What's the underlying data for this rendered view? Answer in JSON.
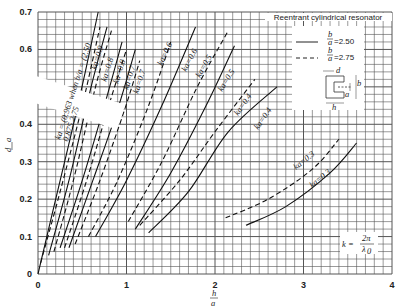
{
  "chart_data": {
    "type": "line",
    "title": "Reentrant cylindrical resonator",
    "xlabel": "h/a",
    "ylabel": "d/a",
    "xlim": [
      0,
      4
    ],
    "ylim": [
      0,
      0.7
    ],
    "x_ticks": [
      "0",
      "1",
      "2",
      "3",
      "4"
    ],
    "y_ticks": [
      "0",
      "0.1",
      "0.2",
      "0.3",
      "0.4",
      "0.5",
      "0.6",
      "0.7"
    ],
    "grid": true,
    "legend": {
      "title": "Reentrant cylindrical resonator",
      "position": "upper right",
      "entries": [
        {
          "style": "solid",
          "label": "b/a=2.50"
        },
        {
          "style": "dashed",
          "label": "b/a=2.75"
        }
      ]
    },
    "annotations": [
      "ka = { 0.963 / 0.875 when b/a = { 2.50 / 2.75",
      "k = 2π/λ0"
    ],
    "series": [
      {
        "name": "ka=0.963 (b/a=2.50)",
        "style": "solid",
        "points": [
          [
            0,
            0
          ],
          [
            0.2,
            0.2
          ],
          [
            0.45,
            0.45
          ],
          [
            0.68,
            0.7
          ]
        ]
      },
      {
        "name": "ka=0.875 (b/a=2.75)",
        "style": "dashed",
        "points": [
          [
            0.03,
            0.03
          ],
          [
            0.25,
            0.22
          ],
          [
            0.5,
            0.45
          ],
          [
            0.7,
            0.66
          ]
        ]
      },
      {
        "name": "ka=0.9 (b/a=2.50)",
        "style": "solid",
        "points": [
          [
            0.12,
            0.05
          ],
          [
            0.35,
            0.25
          ],
          [
            0.6,
            0.5
          ],
          [
            0.78,
            0.66
          ]
        ]
      },
      {
        "name": "ka=0.9 (b/a=2.75)",
        "style": "dashed",
        "points": [
          [
            0.18,
            0.06
          ],
          [
            0.4,
            0.25
          ],
          [
            0.65,
            0.5
          ],
          [
            0.83,
            0.65
          ]
        ]
      },
      {
        "name": "ka=0.8 (b/a=2.50)",
        "style": "solid",
        "points": [
          [
            0.25,
            0.07
          ],
          [
            0.5,
            0.25
          ],
          [
            0.75,
            0.45
          ],
          [
            0.95,
            0.62
          ]
        ]
      },
      {
        "name": "ka=0.8 (b/a=2.75)",
        "style": "dashed",
        "points": [
          [
            0.3,
            0.07
          ],
          [
            0.55,
            0.25
          ],
          [
            0.8,
            0.45
          ],
          [
            1.0,
            0.6
          ]
        ]
      },
      {
        "name": "ka=0.7 (b/a=2.50)",
        "style": "solid",
        "points": [
          [
            0.35,
            0.07
          ],
          [
            0.62,
            0.25
          ],
          [
            0.9,
            0.44
          ],
          [
            1.1,
            0.6
          ]
        ]
      },
      {
        "name": "ka=0.7 (b/a=2.75)",
        "style": "dashed",
        "points": [
          [
            0.42,
            0.08
          ],
          [
            0.7,
            0.25
          ],
          [
            0.98,
            0.44
          ],
          [
            1.15,
            0.57
          ]
        ]
      },
      {
        "name": "ka=0.6 (b/a=2.50)",
        "style": "solid",
        "points": [
          [
            0.65,
            0.1
          ],
          [
            1.0,
            0.25
          ],
          [
            1.4,
            0.45
          ],
          [
            1.78,
            0.66
          ]
        ]
      },
      {
        "name": "ka=0.6 (b/a=2.75)",
        "style": "dashed",
        "points": [
          [
            0.57,
            0.1
          ],
          [
            0.9,
            0.25
          ],
          [
            1.25,
            0.45
          ],
          [
            1.5,
            0.62
          ]
        ]
      },
      {
        "name": "ka=0.5 (b/a=2.50)",
        "style": "solid",
        "points": [
          [
            1.1,
            0.12
          ],
          [
            1.5,
            0.27
          ],
          [
            1.9,
            0.45
          ],
          [
            2.22,
            0.61
          ]
        ]
      },
      {
        "name": "ka=0.5 (b/a=2.75)",
        "style": "dashed",
        "points": [
          [
            1.02,
            0.14
          ],
          [
            1.4,
            0.3
          ],
          [
            1.8,
            0.5
          ],
          [
            2.15,
            0.65
          ]
        ]
      },
      {
        "name": "ka=0.4 (b/a=2.50)",
        "style": "solid",
        "points": [
          [
            1.25,
            0.11
          ],
          [
            1.7,
            0.22
          ],
          [
            2.15,
            0.38
          ],
          [
            2.7,
            0.5
          ]
        ]
      },
      {
        "name": "ka=0.4 (b/a=2.75)",
        "style": "dashed",
        "points": [
          [
            1.15,
            0.13
          ],
          [
            1.6,
            0.25
          ],
          [
            2.0,
            0.38
          ],
          [
            2.45,
            0.52
          ]
        ]
      },
      {
        "name": "ka=0.3 (b/a=2.50)",
        "style": "solid",
        "points": [
          [
            2.35,
            0.13
          ],
          [
            2.8,
            0.18
          ],
          [
            3.3,
            0.27
          ],
          [
            3.6,
            0.35
          ]
        ]
      },
      {
        "name": "ka=0.3 (b/a=2.75)",
        "style": "dashed",
        "points": [
          [
            2.12,
            0.15
          ],
          [
            2.6,
            0.2
          ],
          [
            3.1,
            0.28
          ],
          [
            3.4,
            0.36
          ]
        ]
      }
    ]
  },
  "labels": {
    "legend_title": "Reentrant cylindrical resonator",
    "legend_solid": "=2.50",
    "legend_dashed": "=2.75",
    "k_formula": "k =",
    "k_num": "2π",
    "k_den": "λ",
    "k_sub": "0",
    "xlabel_num": "h",
    "xlabel_den": "a",
    "ylabel_num": "d",
    "ylabel_den": "a",
    "ba_num": "b",
    "ba_den": "a",
    "diagram_d": "d",
    "diagram_b": "b",
    "diagram_a": "a",
    "diagram_h": "h",
    "ka_main": "ka = (0.963 when b/a = (2.50",
    "ka_main2": "0.875          2.75",
    "curve_labels": [
      "ka=0.9",
      "ka=0.8",
      "ka=0.8",
      "ka=0.7",
      "ka=0.7",
      "ka=0.6",
      "ka=0.6",
      "ka=0.5",
      "ka=0.5",
      "ka=0.4",
      "ka=0.4",
      "ka=0.3",
      "ka=0.3"
    ]
  }
}
